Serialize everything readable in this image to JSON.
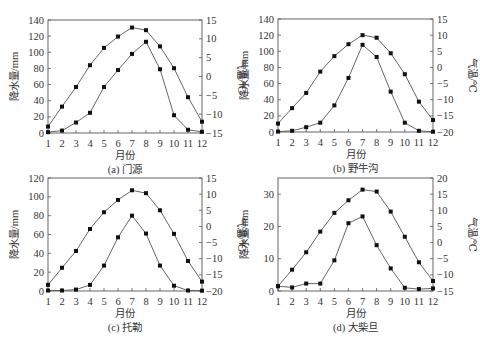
{
  "chart_data": [
    {
      "id": "a",
      "type": "line",
      "title": "(a) 门源",
      "caption": "(a) 门源",
      "xlabel": "月份",
      "ylabel": "降水量/mm",
      "ylabel_right": "气温/℃",
      "categories": [
        1,
        2,
        3,
        4,
        5,
        6,
        7,
        8,
        9,
        10,
        11,
        12
      ],
      "ylim": [
        0,
        140
      ],
      "ylim_right": [
        -15,
        15
      ],
      "yticks": [
        0,
        20,
        40,
        60,
        80,
        100,
        120,
        140
      ],
      "yticks_right": [
        -15,
        -10,
        -5,
        0,
        5,
        10,
        15
      ],
      "grid": false,
      "series": [
        {
          "name": "降水量",
          "axis": "left",
          "values": [
            1,
            3,
            13,
            25,
            57,
            78,
            98,
            113,
            79,
            22,
            4,
            1.5
          ]
        },
        {
          "name": "气温",
          "axis": "right",
          "values": [
            -13.3,
            -8.0,
            -2.8,
            3.0,
            7.6,
            10.6,
            13.0,
            12.3,
            8.0,
            2.2,
            -5.5,
            -12.0
          ]
        }
      ]
    },
    {
      "id": "b",
      "type": "line",
      "title": "(b) 野牛沟",
      "caption": "(b) 野牛沟",
      "xlabel": "月份",
      "ylabel": "降水量/mm",
      "ylabel_right": "气温/℃",
      "categories": [
        1,
        2,
        3,
        4,
        5,
        6,
        7,
        8,
        9,
        10,
        11,
        12
      ],
      "ylim": [
        0,
        140
      ],
      "ylim_right": [
        -20,
        15
      ],
      "yticks": [
        0,
        20,
        40,
        60,
        80,
        100,
        120,
        140
      ],
      "yticks_right": [
        -20,
        -15,
        -10,
        -5,
        0,
        5,
        10,
        15
      ],
      "grid": false,
      "series": [
        {
          "name": "降水量",
          "axis": "left",
          "values": [
            0.5,
            1.5,
            6,
            11.5,
            33,
            67,
            108,
            93,
            50,
            11.5,
            1.5,
            0.3
          ]
        },
        {
          "name": "气温",
          "axis": "right",
          "values": [
            -17.4,
            -12.6,
            -7.9,
            -1.3,
            3.5,
            7.2,
            10.0,
            9.2,
            4.4,
            -2.1,
            -10.6,
            -16.3
          ]
        }
      ]
    },
    {
      "id": "c",
      "type": "line",
      "title": "(c) 托勒",
      "caption": "(c) 托勒",
      "xlabel": "月份",
      "ylabel": "降水量/mm",
      "ylabel_right": "气温/℃",
      "categories": [
        1,
        2,
        3,
        4,
        5,
        6,
        7,
        8,
        9,
        10,
        11,
        12
      ],
      "ylim": [
        0,
        120
      ],
      "ylim_right": [
        -20,
        15
      ],
      "yticks": [
        0,
        20,
        40,
        60,
        80,
        100,
        120
      ],
      "yticks_right": [
        -20,
        -15,
        -10,
        -5,
        0,
        5,
        10,
        15
      ],
      "grid": false,
      "series": [
        {
          "name": "降水量",
          "axis": "left",
          "values": [
            0.5,
            0.5,
            1.5,
            6.5,
            27,
            57,
            80,
            61,
            27,
            5.6,
            0.5,
            0.3
          ]
        },
        {
          "name": "气温",
          "axis": "right",
          "values": [
            -18.1,
            -12.8,
            -7.6,
            -0.8,
            4.4,
            8.2,
            11.2,
            10.3,
            5.0,
            -2.3,
            -10.7,
            -17.1
          ]
        }
      ]
    },
    {
      "id": "d",
      "type": "line",
      "title": "(d) 大柴旦",
      "caption": "(d) 大柴旦",
      "xlabel": "月份",
      "ylabel": "降水量/mm",
      "ylabel_right": "气温/℃",
      "categories": [
        1,
        2,
        3,
        4,
        5,
        6,
        7,
        8,
        9,
        10,
        11,
        12
      ],
      "ylim": [
        0,
        35
      ],
      "ylim_right": [
        -15,
        20
      ],
      "yticks": [
        0,
        10,
        20,
        30
      ],
      "yticks_right": [
        -15,
        -10,
        -5,
        0,
        5,
        10,
        15,
        20
      ],
      "grid": false,
      "series": [
        {
          "name": "降水量",
          "axis": "left",
          "values": [
            1.5,
            1.1,
            2.3,
            2.3,
            9.5,
            21,
            23.1,
            14.2,
            7.0,
            1.0,
            0.6,
            0.8
          ]
        },
        {
          "name": "气温",
          "axis": "right",
          "values": [
            -13.5,
            -8.4,
            -3.0,
            3.4,
            9.2,
            13.1,
            16.4,
            15.8,
            9.6,
            1.8,
            -6.1,
            -11.9
          ]
        }
      ]
    }
  ],
  "layout": {
    "panels": [
      {
        "id": "a",
        "x0": 48,
        "x1": 202,
        "y0": 20,
        "y1": 133
      },
      {
        "id": "b",
        "x0": 278,
        "x1": 433,
        "y0": 19,
        "y1": 132
      },
      {
        "id": "c",
        "x0": 48,
        "x1": 202,
        "y0": 178,
        "y1": 291
      },
      {
        "id": "d",
        "x0": 278,
        "x1": 433,
        "y0": 178,
        "y1": 291
      }
    ]
  }
}
